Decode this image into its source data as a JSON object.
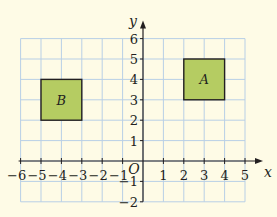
{
  "diagram": {
    "type": "coordinate-grid",
    "x_axis": {
      "label": "x",
      "min": -6,
      "max": 5,
      "ticks": [
        "-6",
        "-5",
        "-4",
        "-3",
        "-2",
        "-1",
        "1",
        "2",
        "3",
        "4",
        "5"
      ]
    },
    "y_axis": {
      "label": "y",
      "min": -2,
      "max": 6,
      "ticks": [
        "-2",
        "-1",
        "1",
        "2",
        "3",
        "4",
        "5",
        "6"
      ]
    },
    "origin_label": "O",
    "shapes": [
      {
        "label": "A",
        "x1": 2,
        "y1": 3,
        "x2": 4,
        "y2": 5,
        "fill": "#b5cc62"
      },
      {
        "label": "B",
        "x1": -5,
        "y1": 2,
        "x2": -3,
        "y2": 4,
        "fill": "#b5cc62"
      }
    ],
    "colors": {
      "background": "#fefbe6",
      "grid": "#b8cfe6",
      "axis": "#231f20",
      "shape_stroke": "#231f20"
    }
  }
}
